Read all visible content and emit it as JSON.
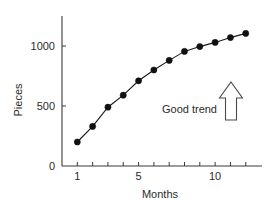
{
  "chart_data": {
    "type": "line",
    "title": "",
    "xlabel": "Months",
    "ylabel": "Pieces",
    "x": [
      1,
      2,
      3,
      4,
      5,
      6,
      7,
      8,
      9,
      10,
      11,
      12
    ],
    "values": [
      200,
      330,
      490,
      590,
      710,
      800,
      880,
      955,
      995,
      1030,
      1070,
      1105
    ],
    "series": [
      {
        "name": "Pieces produced",
        "values": [
          200,
          330,
          490,
          590,
          710,
          800,
          880,
          955,
          995,
          1030,
          1070,
          1105
        ]
      }
    ],
    "xlim": [
      0,
      12.8
    ],
    "ylim": [
      0,
      1200
    ],
    "x_ticks": [
      1,
      2,
      3,
      4,
      5,
      6,
      7,
      8,
      9,
      10,
      11,
      12
    ],
    "x_tick_labels": [
      "1",
      "",
      "",
      "",
      "5",
      "",
      "",
      "",
      "",
      "10",
      "",
      ""
    ],
    "y_ticks": [
      0,
      500,
      1000
    ],
    "y_tick_labels": [
      "0",
      "500",
      "1000"
    ],
    "grid": false,
    "legend": "none",
    "marker": "filled-circle",
    "annotations": [
      {
        "name": "good-trend",
        "text": "Good trend",
        "icon": "up-arrow-outline-icon",
        "x": 9.4,
        "y": 420
      }
    ],
    "colors": {
      "line": "#1a1a1a",
      "marker": "#111111",
      "axis": "#3a3a3a",
      "text": "#2b2b2b",
      "annotation_arrow": "#4a4a4a",
      "background": "#ffffff"
    }
  }
}
